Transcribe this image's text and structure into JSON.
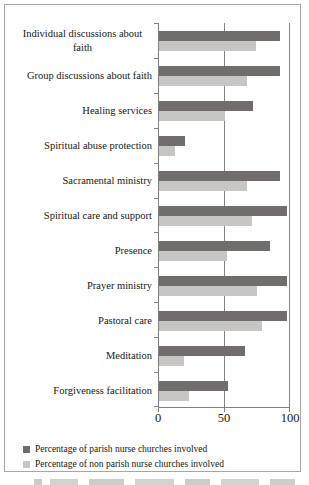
{
  "chart_data": {
    "type": "bar",
    "orientation": "horizontal",
    "title": "",
    "xlabel": "",
    "ylabel": "",
    "categories": [
      "Individual discussions about faith",
      "Group discussions about faith",
      "Healing services",
      "Spiritual abuse protection",
      "Sacramental ministry",
      "Spiritual care and support",
      "Presence",
      "Prayer ministry",
      "Pastoral care",
      "Meditation",
      "Forgiveness facilitation"
    ],
    "series": [
      {
        "name": "Percentage of parish nurse churches involved",
        "color": "#716d6d",
        "values": [
          92,
          92,
          72,
          20,
          92,
          98,
          85,
          98,
          98,
          66,
          53
        ]
      },
      {
        "name": "Percentage of non parish nurse churches involved",
        "color": "#c8c5c5",
        "values": [
          74,
          67,
          50,
          12,
          67,
          71,
          52,
          75,
          79,
          19,
          23
        ]
      }
    ],
    "xlim": [
      0,
      100
    ],
    "x_ticks": [
      0,
      50,
      100
    ],
    "gridlines": [
      50,
      100
    ],
    "grid": "vertical",
    "legend_position": "bottom-left"
  },
  "colors": {
    "axis": "#808080",
    "frame_border": "#a9a5a5",
    "text": "#161616"
  }
}
